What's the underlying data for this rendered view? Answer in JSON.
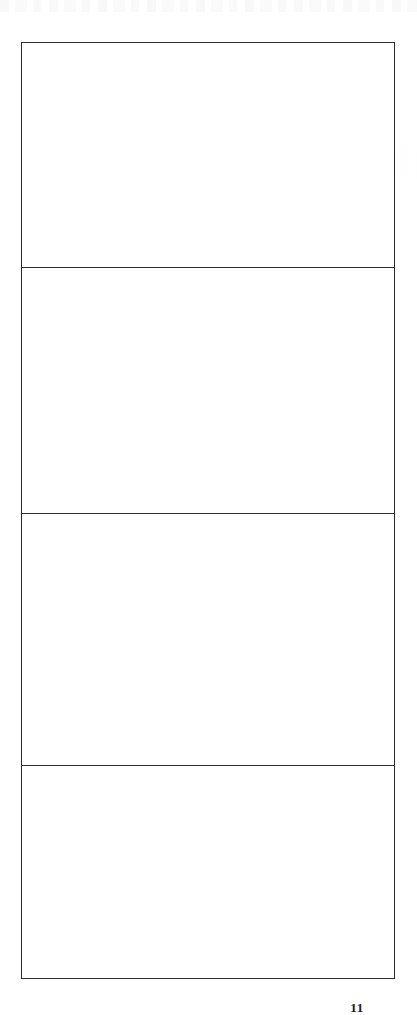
{
  "document": {
    "kind": "scanned-page",
    "page_background": "#ffffff",
    "ink_color": "#2b2b2b",
    "page_number": "11",
    "page_number_clipped": true
  },
  "table": {
    "name": "blank-table",
    "column_count": 1,
    "row_count": 4,
    "border_color": "#2b2b2b",
    "border_width_px": 1.4,
    "columns": [
      {
        "header": "",
        "width_px": 374
      }
    ],
    "rows": [
      {
        "id": "row-1",
        "height_px": 225,
        "cells": [
          ""
        ]
      },
      {
        "id": "row-2",
        "height_px": 246,
        "cells": [
          ""
        ]
      },
      {
        "id": "row-3",
        "height_px": 252,
        "cells": [
          ""
        ]
      },
      {
        "id": "row-4",
        "height_px": 213,
        "cells": [
          ""
        ]
      }
    ]
  },
  "artifacts": {
    "top_edge_ghost_text": "",
    "note": ""
  }
}
